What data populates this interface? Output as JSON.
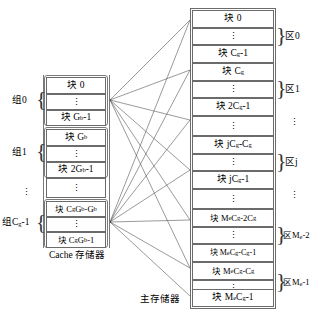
{
  "diagram": {
    "title_cache": "Cache 存储器",
    "title_memory": "主存储器",
    "cache": {
      "groups": [
        {
          "label": "组0",
          "rows": [
            "块 0",
            "⋮",
            "块 Gb-1"
          ]
        },
        {
          "label": "组1",
          "rows": [
            "块 Gb",
            "⋮",
            "块 2Gb-1"
          ]
        },
        {
          "label": "⋮",
          "rows": [
            "⋮"
          ]
        },
        {
          "label": "组Cg-1",
          "rows": [
            "块 CgGb-Gb",
            "⋮",
            "块 CgGb-1"
          ]
        }
      ],
      "row_texts": {
        "g0_r0": "块 0",
        "g0_r1": "⋮",
        "g0_r2": "块 G",
        "g0_r2_sub": "b",
        "g0_r2_tail": "-1",
        "g1_r0_head": "块 G",
        "g1_r0_sub": "b",
        "g1_r1": "⋮",
        "g1_r2_head": "块 2G",
        "g1_r2_sub": "b",
        "g1_r2_tail": "-1",
        "mid_dots": "⋮",
        "gl_r0_head": "块 C",
        "gl_r0_sub1": "g",
        "gl_r0_mid": "G",
        "gl_r0_sub2": "b",
        "gl_r0_mid2": "-G",
        "gl_r0_sub3": "b",
        "gl_r1": "⋮",
        "gl_r2_head": "块 C",
        "gl_r2_sub1": "g",
        "gl_r2_mid": "G",
        "gl_r2_sub2": "b",
        "gl_r2_tail": "-1"
      },
      "group_labels": {
        "g0": "组0",
        "g1": "组1",
        "dots": "⋮",
        "glast_head": "组C",
        "glast_sub": "g",
        "glast_tail": "-1"
      }
    },
    "memory": {
      "zones": [
        {
          "label": "区0",
          "rows": [
            "块 0",
            "⋮",
            "块 Cg-1"
          ]
        },
        {
          "label": "区1",
          "rows": [
            "块 Cg",
            "⋮",
            "块 2Cg-1"
          ]
        },
        {
          "label": "⋮",
          "rows": [
            "⋮"
          ]
        },
        {
          "label": "区j",
          "rows": [
            "块 jCg-Cg",
            "⋮",
            "块 jCg-1"
          ]
        },
        {
          "label": "⋮",
          "rows": [
            "⋮"
          ]
        },
        {
          "label": "区Me-2",
          "rows": [
            "块 MeCg-2Cg",
            "⋮",
            "块 MeCg-Cg-1"
          ]
        },
        {
          "label": "区Me-1",
          "rows": [
            "块 MeCg-Cg",
            "⋮",
            "块 MeCg-1"
          ]
        }
      ],
      "row_texts": {
        "r0": "块 0",
        "r1": "⋮",
        "r2_head": "块 C",
        "r2_sub": "g",
        "r2_tail": "-1",
        "r3_head": "块 C",
        "r3_sub": "g",
        "r4": "⋮",
        "r5_head": "块 2C",
        "r5_sub": "g",
        "r5_tail": "-1",
        "r6": "⋮",
        "r7_head": "块 jC",
        "r7_sub1": "g",
        "r7_mid": "-C",
        "r7_sub2": "g",
        "r8": "⋮",
        "r9_head": "块 jC",
        "r9_sub": "g",
        "r9_tail": "-1",
        "r10": "⋮",
        "r11_head": "块 M",
        "r11_sub1": "e",
        "r11_mid": "C",
        "r11_sub2": "g",
        "r11_mid2": "-2C",
        "r11_sub3": "g",
        "r12": "⋮",
        "r13_head": "块 M",
        "r13_sub1": "e",
        "r13_mid": "C",
        "r13_sub2": "g",
        "r13_mid2": "-C",
        "r13_sub3": "g",
        "r13_tail": "-1",
        "r14_head": "块 M",
        "r14_sub1": "e",
        "r14_mid": "C",
        "r14_sub2": "g",
        "r14_mid2": "-C",
        "r14_sub3": "g",
        "r15": "⋮",
        "r16_head": "块 M",
        "r16_sub1": "e",
        "r16_mid": "C",
        "r16_sub2": "g",
        "r16_tail": "-1"
      },
      "zone_labels": {
        "z0": "区0",
        "z1": "区1",
        "dots1": "⋮",
        "zj": "区j",
        "dots2": "⋮",
        "zm2_head": "区M",
        "zm2_sub": "e",
        "zm2_tail": "-2",
        "zm1_head": "区M",
        "zm1_sub": "e",
        "zm1_tail": "-1"
      }
    },
    "colors": {
      "line": "#6b6b6b",
      "text": "#000000",
      "background": "#ffffff"
    }
  }
}
